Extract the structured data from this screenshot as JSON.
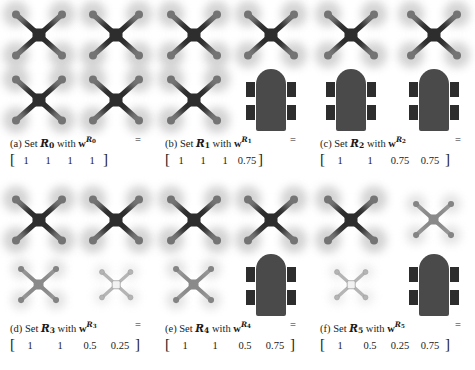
{
  "figure": {
    "type": "robot-team-composition-grid",
    "rows": 2,
    "cols": 3,
    "colors": {
      "robot_dark": "#2d2d2d",
      "robot_mid": "#8a8a8a",
      "robot_light": "#f2f2f2",
      "robot_light_stroke": "#b5b5b5",
      "vehicle_body": "#4a4a4a",
      "vehicle_wheel": "#2d2d2d",
      "rotor_wash": "#b0b0b0",
      "background": "#ffffff",
      "text": "#1a1a1a"
    },
    "legend_note": "Darker and larger icons denote higher weight; aerial X-shaped icons are quadrotors, dome-shaped icons with four wheels are ground vehicles."
  },
  "panels": [
    {
      "tag": "(a)",
      "set_word": "Set",
      "set_symbol": "R",
      "set_subscript": "0",
      "with_word": "with",
      "weight_symbol": "w",
      "equals": "=",
      "open_bracket": "[",
      "close_bracket": "]",
      "weights": [
        "1",
        "1",
        "1",
        "1"
      ],
      "num_width": "narrow",
      "robots": [
        {
          "kind": "quadrotor",
          "weight": 1
        },
        {
          "kind": "quadrotor",
          "weight": 1
        },
        {
          "kind": "quadrotor",
          "weight": 1
        },
        {
          "kind": "quadrotor",
          "weight": 1
        }
      ]
    },
    {
      "tag": "(b)",
      "set_word": "Set",
      "set_symbol": "R",
      "set_subscript": "1",
      "with_word": "with",
      "weight_symbol": "w",
      "equals": "=",
      "open_bracket": "[",
      "close_bracket": "]",
      "weights": [
        "1",
        "1",
        "1",
        "0.75"
      ],
      "num_width": "narrow",
      "robots": [
        {
          "kind": "quadrotor",
          "weight": 1
        },
        {
          "kind": "quadrotor",
          "weight": 1
        },
        {
          "kind": "quadrotor",
          "weight": 1
        },
        {
          "kind": "ground-vehicle",
          "weight": 0.75
        }
      ]
    },
    {
      "tag": "(c)",
      "set_word": "Set",
      "set_symbol": "R",
      "set_subscript": "2",
      "with_word": "with",
      "weight_symbol": "w",
      "equals": "=",
      "open_bracket": "[",
      "close_bracket": "]",
      "weights": [
        "1",
        "1",
        "0.75",
        "0.75"
      ],
      "num_width": "wide",
      "robots": [
        {
          "kind": "quadrotor",
          "weight": 1
        },
        {
          "kind": "quadrotor",
          "weight": 1
        },
        {
          "kind": "ground-vehicle",
          "weight": 0.75
        },
        {
          "kind": "ground-vehicle",
          "weight": 0.75
        }
      ]
    },
    {
      "tag": "(d)",
      "set_word": "Set",
      "set_symbol": "R",
      "set_subscript": "3",
      "with_word": "with",
      "weight_symbol": "w",
      "equals": "=",
      "open_bracket": "[",
      "close_bracket": "]",
      "weights": [
        "1",
        "1",
        "0.5",
        "0.25"
      ],
      "num_width": "wide",
      "robots": [
        {
          "kind": "quadrotor",
          "weight": 1
        },
        {
          "kind": "quadrotor",
          "weight": 1
        },
        {
          "kind": "quadrotor",
          "weight": 0.5
        },
        {
          "kind": "quadrotor",
          "weight": 0.25
        }
      ]
    },
    {
      "tag": "(e)",
      "set_word": "Set",
      "set_symbol": "R",
      "set_subscript": "4",
      "with_word": "with",
      "weight_symbol": "w",
      "equals": "=",
      "open_bracket": "[",
      "close_bracket": "]",
      "weights": [
        "1",
        "1",
        "0.5",
        "0.75"
      ],
      "num_width": "wide",
      "robots": [
        {
          "kind": "quadrotor",
          "weight": 1
        },
        {
          "kind": "quadrotor",
          "weight": 1
        },
        {
          "kind": "quadrotor",
          "weight": 0.5
        },
        {
          "kind": "ground-vehicle",
          "weight": 0.75
        }
      ]
    },
    {
      "tag": "(f)",
      "set_word": "Set",
      "set_symbol": "R",
      "set_subscript": "5",
      "with_word": "with",
      "weight_symbol": "w",
      "equals": "=",
      "open_bracket": "[",
      "close_bracket": "]",
      "weights": [
        "1",
        "0.5",
        "0.25",
        "0.75"
      ],
      "num_width": "wide",
      "robots": [
        {
          "kind": "quadrotor",
          "weight": 1
        },
        {
          "kind": "quadrotor",
          "weight": 0.5
        },
        {
          "kind": "quadrotor",
          "weight": 0.25
        },
        {
          "kind": "ground-vehicle",
          "weight": 0.75
        }
      ]
    }
  ]
}
